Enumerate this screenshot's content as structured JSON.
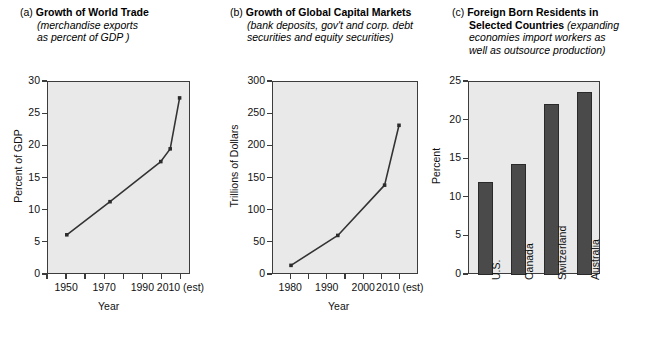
{
  "figure": {
    "background": "#ffffff",
    "plot_background": "#e9e9e9",
    "line_color": "#333333",
    "bar_color": "#4a4a4a",
    "axis_color": "#3c3c3c"
  },
  "panels": [
    {
      "letter": "(a)",
      "title": "Growth of World Trade",
      "subtitle_line1": "(merchandise exports",
      "subtitle_line2": "as percent of GDP )"
    },
    {
      "letter": "(b)",
      "title": "Growth of Global Capital Markets",
      "subtitle_line1": "(bank deposits, gov't and corp. debt",
      "subtitle_line2": "securities and equity securities)"
    },
    {
      "letter": "(c)",
      "title": "Foreign Born Residents in Selected Countries",
      "title_line1": "Foreign Born Residents in",
      "title_line2": "Selected Countries",
      "subtitle_line2a": "(expanding",
      "subtitle_line3": "economies import workers as",
      "subtitle_line4": "well as outsource production)"
    }
  ],
  "chart_data": [
    {
      "type": "line",
      "title": "(a) Growth of World Trade (merchandise exports as percent of GDP )",
      "xlabel": "Year",
      "ylabel": "Percent of GDP",
      "xlim": [
        1940,
        2015
      ],
      "ylim": [
        0,
        30
      ],
      "yticks": [
        0,
        5,
        10,
        15,
        20,
        25,
        30
      ],
      "ytick_labels": [
        "0",
        "5",
        "10",
        "15",
        "20",
        "25",
        "30"
      ],
      "xticks": [
        1940,
        1950,
        1960,
        1970,
        1980,
        1990,
        2000,
        2010
      ],
      "xtick_labels": [
        "1950",
        "1970",
        "1990",
        "2010 (est)"
      ],
      "xtick_label_values": [
        1950,
        1970,
        1990,
        2010
      ],
      "grid": false,
      "legend": "none",
      "x": [
        1950,
        1973,
        2000,
        2005,
        2010
      ],
      "y": [
        6.0,
        11.2,
        17.5,
        19.5,
        27.5
      ],
      "markers": true
    },
    {
      "type": "line",
      "title": "(b) Growth of Global Capital Markets (bank deposits, gov't and corp. debt securities and equity securities)",
      "xlabel": "Year",
      "ylabel": "Trillions of Dollars",
      "xlim": [
        1975,
        2015
      ],
      "ylim": [
        0,
        300
      ],
      "yticks": [
        0,
        50,
        100,
        150,
        200,
        250,
        300
      ],
      "ytick_labels": [
        "0",
        "50",
        "100",
        "150",
        "200",
        "250",
        "300"
      ],
      "xticks": [
        1980,
        1985,
        1990,
        1995,
        2000,
        2005,
        2010
      ],
      "xtick_labels": [
        "1980",
        "1990",
        "2000",
        "2010 (est)"
      ],
      "xtick_label_values": [
        1980,
        1990,
        2000,
        2010
      ],
      "grid": false,
      "legend": "none",
      "x": [
        1980,
        1993,
        2006,
        2010
      ],
      "y": [
        12,
        59,
        138,
        232
      ],
      "markers": true
    },
    {
      "type": "bar",
      "title": "(c) Foreign Born Residents in Selected Countries (expanding economies import workers as well as outsource production)",
      "xlabel": "",
      "ylabel": "Percent",
      "ylim": [
        0,
        25
      ],
      "yticks": [
        0,
        5,
        10,
        15,
        20,
        25
      ],
      "ytick_labels": [
        "0",
        "5",
        "10",
        "15",
        "20",
        "25"
      ],
      "grid": false,
      "legend": "none",
      "categories": [
        "U.S.",
        "Canada",
        "Switzerland",
        "Australia"
      ],
      "values": [
        12.1,
        14.4,
        22.1,
        23.7
      ]
    }
  ]
}
